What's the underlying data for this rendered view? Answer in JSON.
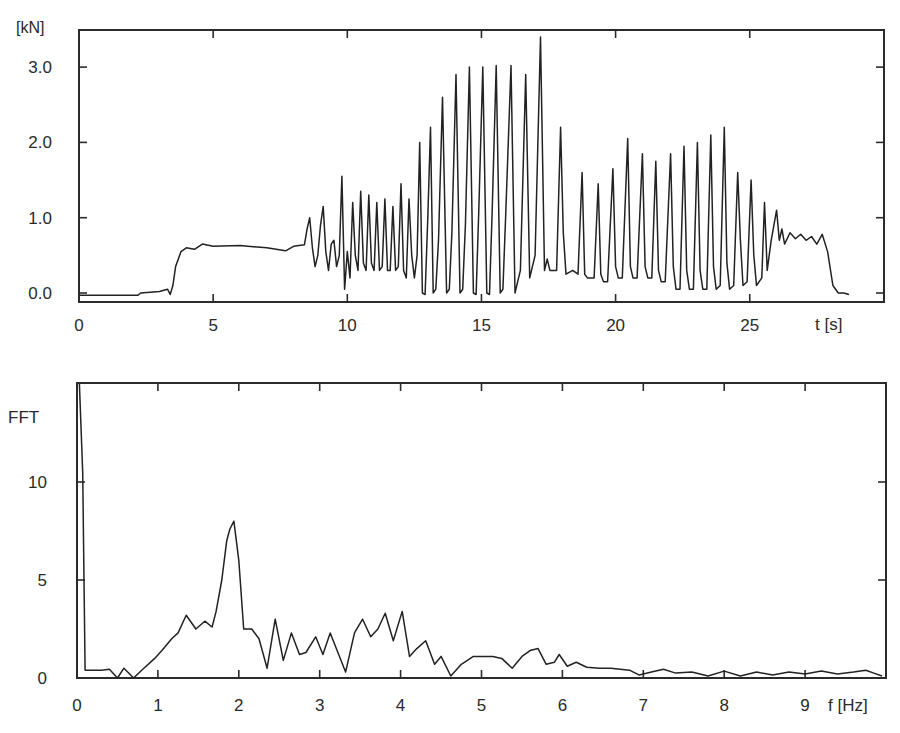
{
  "chart_data": [
    {
      "type": "line",
      "title": "",
      "ylabel": "[kN]",
      "xlabel": "t [s]",
      "xlim": [
        0,
        30
      ],
      "ylim": [
        -0.12,
        3.5
      ],
      "grid": false,
      "legend": null,
      "x_ticks": [
        0,
        5,
        10,
        15,
        20,
        25
      ],
      "x_tick_labels": [
        "0",
        "5",
        "10",
        "15",
        "20",
        "25"
      ],
      "y_ticks": [
        0.0,
        1.0,
        2.0,
        3.0
      ],
      "y_tick_labels": [
        "0.0",
        "1.0",
        "2.0",
        "3.0"
      ],
      "series": [
        {
          "name": "force",
          "x": [
            0,
            2.2,
            2.3,
            3.0,
            3.3,
            3.4,
            3.5,
            3.6,
            3.8,
            4.0,
            4.3,
            4.6,
            5.0,
            6.0,
            7.0,
            7.7,
            8.0,
            8.4,
            8.5,
            8.6,
            8.7,
            8.8,
            8.9,
            9.0,
            9.1,
            9.2,
            9.3,
            9.4,
            9.5,
            9.6,
            9.7,
            9.8,
            9.9,
            10.0,
            10.1,
            10.2,
            10.3,
            10.4,
            10.5,
            10.6,
            10.7,
            10.8,
            10.9,
            11.0,
            11.1,
            11.2,
            11.3,
            11.4,
            11.5,
            11.6,
            11.7,
            11.8,
            11.9,
            12.0,
            12.1,
            12.2,
            12.3,
            12.4,
            12.5,
            12.6,
            12.7,
            12.8,
            12.9,
            13.0,
            13.1,
            13.2,
            13.3,
            13.4,
            13.55,
            13.7,
            13.8,
            13.9,
            14.05,
            14.2,
            14.3,
            14.4,
            14.55,
            14.7,
            14.8,
            14.9,
            15.05,
            15.2,
            15.3,
            15.4,
            15.55,
            15.7,
            15.8,
            15.9,
            16.1,
            16.25,
            16.35,
            16.45,
            16.65,
            16.8,
            16.9,
            17.0,
            17.2,
            17.35,
            17.45,
            17.55,
            17.8,
            17.95,
            18.05,
            18.15,
            18.4,
            18.6,
            18.75,
            18.85,
            18.95,
            19.2,
            19.35,
            19.45,
            19.55,
            19.7,
            19.9,
            20.0,
            20.1,
            20.25,
            20.45,
            20.55,
            20.65,
            20.8,
            21.0,
            21.1,
            21.2,
            21.35,
            21.5,
            21.6,
            21.7,
            21.85,
            22.05,
            22.15,
            22.25,
            22.4,
            22.55,
            22.65,
            22.75,
            22.9,
            23.05,
            23.15,
            23.25,
            23.4,
            23.55,
            23.65,
            23.75,
            23.9,
            24.05,
            24.15,
            24.25,
            24.4,
            24.55,
            24.65,
            24.75,
            24.9,
            25.05,
            25.15,
            25.25,
            25.45,
            25.55,
            25.65,
            25.8,
            26.0,
            26.1,
            26.2,
            26.3,
            26.5,
            26.7,
            26.9,
            27.1,
            27.3,
            27.5,
            27.7,
            27.9,
            28.1,
            28.3,
            28.5,
            28.7,
            28.9,
            29.05,
            29.15,
            29.3,
            29.6,
            30.0
          ],
          "y": [
            -0.03,
            -0.03,
            0.0,
            0.02,
            0.05,
            -0.02,
            0.1,
            0.35,
            0.55,
            0.6,
            0.58,
            0.65,
            0.62,
            0.63,
            0.6,
            0.56,
            0.62,
            0.64,
            0.85,
            1.0,
            0.6,
            0.35,
            0.5,
            0.9,
            1.15,
            0.55,
            0.3,
            0.65,
            0.7,
            0.35,
            0.5,
            1.55,
            0.05,
            0.55,
            0.2,
            1.2,
            0.5,
            0.3,
            1.35,
            0.4,
            0.3,
            1.3,
            0.4,
            0.3,
            1.2,
            0.3,
            0.35,
            1.25,
            0.3,
            0.3,
            1.15,
            0.3,
            0.35,
            1.45,
            0.3,
            0.2,
            1.25,
            0.5,
            0.2,
            0.5,
            2.0,
            0.0,
            -0.02,
            1.0,
            2.2,
            0.0,
            0.05,
            0.7,
            2.6,
            0.0,
            0.05,
            0.8,
            2.9,
            0.0,
            0.05,
            0.9,
            3.0,
            0.0,
            -0.02,
            1.1,
            3.0,
            0.0,
            -0.02,
            1.1,
            3.02,
            0.0,
            0.05,
            1.0,
            3.02,
            0.0,
            0.15,
            0.3,
            2.9,
            0.2,
            0.35,
            0.5,
            3.4,
            0.3,
            0.45,
            0.3,
            0.3,
            2.2,
            0.8,
            0.25,
            0.3,
            0.25,
            1.6,
            0.25,
            0.2,
            0.2,
            1.45,
            0.25,
            0.15,
            0.15,
            1.65,
            0.35,
            0.2,
            0.2,
            2.05,
            0.35,
            0.2,
            0.2,
            1.85,
            0.35,
            0.2,
            0.2,
            1.75,
            0.3,
            0.15,
            0.15,
            1.85,
            0.35,
            0.05,
            0.05,
            1.95,
            0.3,
            0.05,
            0.05,
            2.0,
            0.3,
            0.05,
            0.05,
            2.1,
            0.35,
            0.05,
            0.1,
            2.2,
            0.4,
            0.05,
            0.1,
            1.6,
            0.7,
            0.1,
            0.15,
            1.5,
            0.5,
            0.1,
            0.2,
            1.2,
            0.3,
            0.7,
            1.1,
            0.7,
            0.85,
            0.65,
            0.8,
            0.72,
            0.78,
            0.7,
            0.75,
            0.65,
            0.78,
            0.55,
            0.1,
            0.0,
            0.0,
            -0.02
          ]
        }
      ]
    },
    {
      "type": "line",
      "title": "",
      "ylabel": "FFT",
      "xlabel": "f [Hz]",
      "xlim": [
        0,
        10
      ],
      "ylim": [
        0,
        15
      ],
      "grid": false,
      "legend": null,
      "x_ticks": [
        0,
        1,
        2,
        3,
        4,
        5,
        6,
        7,
        8,
        9
      ],
      "x_tick_labels": [
        "0",
        "1",
        "2",
        "3",
        "4",
        "5",
        "6",
        "7",
        "8",
        "9"
      ],
      "y_ticks": [
        0,
        5,
        10
      ],
      "y_tick_labels": [
        "0",
        "5",
        "10"
      ],
      "series": [
        {
          "name": "FFT magnitude",
          "x": [
            0.03,
            0.07,
            0.1,
            0.2,
            0.3,
            0.4,
            0.5,
            0.58,
            0.7,
            0.8,
            0.96,
            1.05,
            1.17,
            1.25,
            1.35,
            1.47,
            1.58,
            1.67,
            1.72,
            1.79,
            1.85,
            1.89,
            1.94,
            2.0,
            2.06,
            2.16,
            2.25,
            2.35,
            2.45,
            2.55,
            2.65,
            2.75,
            2.83,
            2.95,
            3.04,
            3.13,
            3.32,
            3.43,
            3.53,
            3.63,
            3.72,
            3.81,
            3.91,
            4.02,
            4.11,
            4.2,
            4.31,
            4.42,
            4.5,
            4.62,
            4.75,
            4.9,
            5.0,
            5.14,
            5.25,
            5.38,
            5.5,
            5.6,
            5.7,
            5.8,
            5.9,
            5.96,
            6.06,
            6.17,
            6.3,
            6.46,
            6.6,
            6.83,
            6.95,
            7.1,
            7.25,
            7.4,
            7.6,
            7.8,
            8.0,
            8.2,
            8.4,
            8.6,
            8.8,
            9.0,
            9.2,
            9.4,
            9.6,
            9.75,
            9.85,
            9.95
          ],
          "y": [
            15.0,
            10.5,
            0.4,
            0.4,
            0.4,
            0.45,
            0.0,
            0.5,
            0.0,
            0.4,
            1.0,
            1.4,
            2.0,
            2.3,
            3.2,
            2.5,
            2.9,
            2.6,
            3.4,
            5.0,
            7.0,
            7.6,
            8.0,
            6.0,
            2.5,
            2.5,
            2.0,
            0.5,
            3.0,
            0.9,
            2.3,
            1.2,
            1.3,
            2.1,
            1.2,
            2.3,
            0.3,
            2.3,
            3.0,
            2.1,
            2.5,
            3.3,
            1.9,
            3.4,
            1.1,
            1.5,
            1.9,
            0.7,
            1.1,
            0.1,
            0.7,
            1.1,
            1.1,
            1.1,
            1.0,
            0.5,
            1.1,
            1.4,
            1.5,
            0.7,
            0.8,
            1.2,
            0.6,
            0.8,
            0.55,
            0.5,
            0.5,
            0.4,
            0.15,
            0.3,
            0.45,
            0.25,
            0.3,
            0.1,
            0.35,
            0.1,
            0.3,
            0.15,
            0.3,
            0.2,
            0.35,
            0.2,
            0.3,
            0.4,
            0.25,
            0.1
          ]
        }
      ]
    }
  ],
  "top_chart": {
    "y_unit_label": "[kN]",
    "x_unit_label": "t [s]"
  },
  "bottom_chart": {
    "y_unit_label": "FFT",
    "x_unit_label": "f [Hz]"
  }
}
